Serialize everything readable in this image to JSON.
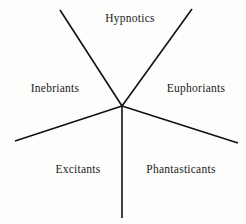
{
  "figure": {
    "title": "",
    "type": "radial-sector-diagram",
    "width": 246,
    "height": 224,
    "background_color": "#fdfdfc",
    "line_color": "#111111",
    "text_color": "#1a1a1a",
    "line_width": 1.6,
    "center": {
      "x": 122,
      "y": 106
    }
  },
  "rays": [
    {
      "name": "ray-upper-left",
      "x1": 122,
      "y1": 106,
      "x2": 60,
      "y2": 10
    },
    {
      "name": "ray-upper-right",
      "x1": 122,
      "y1": 106,
      "x2": 192,
      "y2": 9
    },
    {
      "name": "ray-left",
      "x1": 122,
      "y1": 106,
      "x2": 15,
      "y2": 141
    },
    {
      "name": "ray-right",
      "x1": 122,
      "y1": 106,
      "x2": 238,
      "y2": 143
    },
    {
      "name": "ray-down",
      "x1": 122,
      "y1": 106,
      "x2": 122,
      "y2": 218
    }
  ],
  "labels": [
    {
      "name": "label-hypnotics",
      "text": "Hypnotics",
      "x": 130,
      "y": 19
    },
    {
      "name": "label-inebriants",
      "text": "Inebriants",
      "x": 55,
      "y": 89
    },
    {
      "name": "label-euphoriants",
      "text": "Euphoriants",
      "x": 196,
      "y": 89
    },
    {
      "name": "label-excitants",
      "text": "Excitants",
      "x": 78,
      "y": 170
    },
    {
      "name": "label-phantasticants",
      "text": "Phantasticants",
      "x": 181,
      "y": 170
    }
  ]
}
